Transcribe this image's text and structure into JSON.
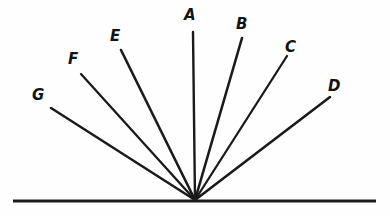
{
  "figure": {
    "background_color": "#fefefe",
    "ink_color": "#1a1a1a",
    "canvas": {
      "width": 390,
      "height": 216
    },
    "vertex": {
      "x": 195,
      "y": 200
    },
    "baseline": {
      "label": "baseline",
      "x1": 13,
      "y1": 201,
      "x2": 376,
      "y2": 201,
      "stroke_width": 3.2
    },
    "rays": [
      {
        "id": "A",
        "label": "A",
        "x1": 195,
        "y1": 200,
        "x2": 193,
        "y2": 32,
        "stroke_width": 2.4,
        "angle_deg": 90.7,
        "label_x": 184,
        "label_y": 8
      },
      {
        "id": "B",
        "label": "B",
        "x1": 195,
        "y1": 200,
        "x2": 242,
        "y2": 38,
        "stroke_width": 2.6,
        "angle_deg": 73.8,
        "label_x": 236,
        "label_y": 17
      },
      {
        "id": "C",
        "label": "C",
        "x1": 195,
        "y1": 200,
        "x2": 287,
        "y2": 56,
        "stroke_width": 2.3,
        "angle_deg": 57.4,
        "label_x": 285,
        "label_y": 40
      },
      {
        "id": "D",
        "label": "D",
        "x1": 195,
        "y1": 200,
        "x2": 330,
        "y2": 97,
        "stroke_width": 2.6,
        "angle_deg": 37.3,
        "label_x": 328,
        "label_y": 79
      },
      {
        "id": "E",
        "label": "E",
        "x1": 195,
        "y1": 200,
        "x2": 121,
        "y2": 50,
        "stroke_width": 2.6,
        "angle_deg": 116.3,
        "label_x": 110,
        "label_y": 29
      },
      {
        "id": "F",
        "label": "F",
        "x1": 195,
        "y1": 200,
        "x2": 81,
        "y2": 74,
        "stroke_width": 2.3,
        "angle_deg": 132.1,
        "label_x": 68,
        "label_y": 52
      },
      {
        "id": "G",
        "label": "G",
        "x1": 195,
        "y1": 200,
        "x2": 51,
        "y2": 108,
        "stroke_width": 2.5,
        "angle_deg": 147.4,
        "label_x": 32,
        "label_y": 88
      }
    ]
  },
  "chart_data": {
    "type": "diagram",
    "subtype": "ray-fan",
    "vertex": {
      "x": 195,
      "y": 200
    },
    "baseline_endpoints": [
      {
        "x": 13,
        "y": 201
      },
      {
        "x": 376,
        "y": 201
      }
    ],
    "labels": [
      "A",
      "B",
      "C",
      "D",
      "E",
      "F",
      "G"
    ],
    "rays": [
      {
        "label": "A",
        "endpoint": {
          "x": 193,
          "y": 32
        },
        "angle_from_baseline_deg": 90.7
      },
      {
        "label": "B",
        "endpoint": {
          "x": 242,
          "y": 38
        },
        "angle_from_baseline_deg": 73.8
      },
      {
        "label": "C",
        "endpoint": {
          "x": 287,
          "y": 56
        },
        "angle_from_baseline_deg": 57.4
      },
      {
        "label": "D",
        "endpoint": {
          "x": 330,
          "y": 97
        },
        "angle_from_baseline_deg": 37.3
      },
      {
        "label": "E",
        "endpoint": {
          "x": 121,
          "y": 50
        },
        "angle_from_baseline_deg": 116.3
      },
      {
        "label": "F",
        "endpoint": {
          "x": 81,
          "y": 74
        },
        "angle_from_baseline_deg": 132.1
      },
      {
        "label": "G",
        "endpoint": {
          "x": 51,
          "y": 108
        },
        "angle_from_baseline_deg": 147.4
      }
    ],
    "grid": false,
    "legend": "none",
    "xlabel": "",
    "ylabel": "",
    "xlim": [
      0,
      390
    ],
    "ylim": [
      0,
      216
    ]
  }
}
